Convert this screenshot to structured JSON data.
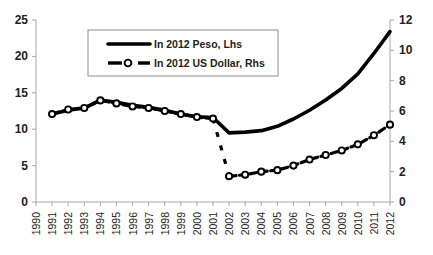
{
  "chart_data": {
    "type": "line",
    "title": "",
    "subtitle": "",
    "xlabel": "",
    "ylabel": "",
    "grid": false,
    "legend_position": "top-center",
    "x": [
      1990,
      1991,
      1992,
      1993,
      1994,
      1995,
      1996,
      1997,
      1998,
      1999,
      2000,
      2001,
      2002,
      2003,
      2004,
      2005,
      2006,
      2007,
      2008,
      2009,
      2010,
      2011,
      2012
    ],
    "categories": [
      "1990",
      "1991",
      "1992",
      "1993",
      "1994",
      "1995",
      "1996",
      "1997",
      "1998",
      "1999",
      "2000",
      "2001",
      "2002",
      "2003",
      "2004",
      "2005",
      "2006",
      "2007",
      "2008",
      "2009",
      "2010",
      "2011",
      "2012"
    ],
    "axes": {
      "left": {
        "label": "In 2012 Peso, Lhs",
        "ylim": [
          0,
          25
        ],
        "ticks": [
          0,
          5,
          10,
          15,
          20,
          25
        ],
        "tick_labels": [
          "0",
          "5",
          "10",
          "15",
          "20",
          "25"
        ]
      },
      "right": {
        "label": "In 2012 US Dollar, Rhs",
        "ylim": [
          0,
          12
        ],
        "ticks": [
          0,
          2,
          4,
          6,
          8,
          10,
          12
        ],
        "tick_labels": [
          "0",
          "2",
          "4",
          "6",
          "8",
          "10",
          "12"
        ]
      },
      "x": {
        "xlim": [
          1990,
          2012
        ],
        "ticks": [
          1990,
          1991,
          1992,
          1993,
          1994,
          1995,
          1996,
          1997,
          1998,
          1999,
          2000,
          2001,
          2002,
          2003,
          2004,
          2005,
          2006,
          2007,
          2008,
          2009,
          2010,
          2011,
          2012
        ]
      }
    },
    "series": [
      {
        "name": "In 2012 Peso, Lhs",
        "axis": "left",
        "color": "#000000",
        "style": "solid-thick",
        "marker": "none",
        "x": [
          1991,
          1992,
          1993,
          1994,
          1995,
          1996,
          1997,
          1998,
          1999,
          2000,
          2001,
          2002,
          2003,
          2004,
          2005,
          2006,
          2007,
          2008,
          2009,
          2010,
          2011,
          2012
        ],
        "values": [
          12.1,
          12.6,
          12.9,
          14.0,
          13.7,
          13.3,
          13.0,
          12.6,
          12.1,
          11.7,
          11.6,
          9.5,
          9.6,
          9.8,
          10.4,
          11.4,
          12.6,
          14.0,
          15.6,
          17.6,
          20.4,
          23.4
        ]
      },
      {
        "name": "In 2012 US Dollar, Rhs",
        "axis": "right",
        "color": "#000000",
        "style": "dashed-marker",
        "marker": "open-circle",
        "x": [
          1991,
          1992,
          1993,
          1994,
          1995,
          1996,
          1997,
          1998,
          1999,
          2000,
          2001,
          2002,
          2003,
          2004,
          2005,
          2006,
          2007,
          2008,
          2009,
          2010,
          2011,
          2012
        ],
        "values": [
          5.8,
          6.1,
          6.2,
          6.7,
          6.5,
          6.3,
          6.2,
          6.0,
          5.8,
          5.6,
          5.5,
          1.7,
          1.8,
          2.0,
          2.1,
          2.4,
          2.8,
          3.1,
          3.4,
          3.8,
          4.4,
          5.1
        ],
        "break_between": [
          2001,
          2002
        ]
      }
    ],
    "legend": {
      "entries": [
        {
          "label": "In  2012 Peso, Lhs",
          "style": "solid-thick"
        },
        {
          "label": "In  2012 US Dollar, Rhs",
          "style": "dashed-marker"
        }
      ]
    }
  },
  "colors": {
    "series": "#000000",
    "axis": "#a6a6a6",
    "text": "#231f20",
    "legend_border": "#8c8c8c",
    "background": "#ffffff"
  }
}
